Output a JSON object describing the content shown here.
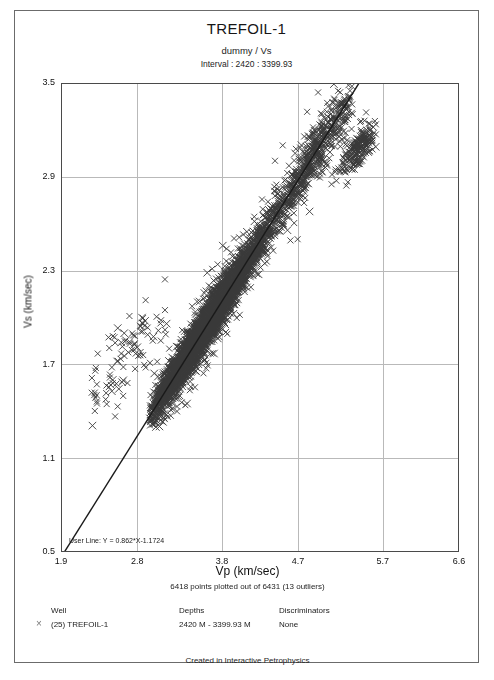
{
  "header": {
    "title": "TREFOIL-1",
    "subtitle": "dummy / Vs",
    "interval": "Interval : 2420 : 3399.93"
  },
  "footer": {
    "credit": "Created in Interactive Petrophysics"
  },
  "legend": {
    "marker_glyph": "×",
    "headers": {
      "well": "Well",
      "depths": "Depths",
      "discriminators": "Discriminators"
    },
    "rows": [
      {
        "marker": "×",
        "well": "(25) TREFOIL-1",
        "depths": "2420 M - 3399.93 M",
        "discriminators": "None"
      }
    ]
  },
  "chart_data": {
    "type": "scatter",
    "title": "TREFOIL-1",
    "subtitle": "dummy / Vs",
    "xlabel": "Vp (km/sec)",
    "ylabel": "Vs (km/sec)",
    "xlim": [
      1.9,
      6.6
    ],
    "ylim": [
      0.5,
      3.5
    ],
    "xticks": [
      1.9,
      2.8,
      3.8,
      4.7,
      5.7,
      6.6
    ],
    "xtick_labels": [
      "1.9",
      "2.8",
      "3.8",
      "4.7",
      "5.7",
      "6.6"
    ],
    "yticks": [
      0.5,
      1.1,
      1.7,
      2.3,
      2.9,
      3.5
    ],
    "ytick_labels": [
      "0.5",
      "1.1",
      "1.7",
      "2.3",
      "2.9",
      "3.5"
    ],
    "grid": true,
    "grid_color": "#b9b9b9",
    "frame_color": "#4a4a4a",
    "marker": "x",
    "marker_color": "#3a3a3a",
    "marker_size": 3.0,
    "n_points_plotted": 6418,
    "n_points_total": 6431,
    "n_outliers": 13,
    "points_note": "6418 points plotted out of 6431 (13 outliers)",
    "annotation": "User Line: Y = 0.862*X-1.1724",
    "fit_line": {
      "label": "User Line: Y = 0.862*X-1.1724",
      "slope": 0.862,
      "intercept": -1.1724,
      "color": "#1a1a1a",
      "width": 1.4
    },
    "clusters": [
      {
        "name": "main-trend",
        "n": 5500,
        "x_range": [
          2.95,
          4.55
        ],
        "x_peak": 3.62,
        "x_spread": 0.33,
        "slope": 0.862,
        "intercept": -1.1724,
        "scatter_perp": 0.055,
        "scatter_tail": 0.11
      },
      {
        "name": "upper-branch",
        "n": 620,
        "x_range": [
          4.25,
          5.35
        ],
        "x_peak": 4.85,
        "x_spread": 0.3,
        "slope": 0.862,
        "intercept": -1.1724,
        "scatter_perp": 0.085,
        "scatter_tail": 0.16
      },
      {
        "name": "high-vs-tail",
        "n": 200,
        "x_range": [
          5.05,
          5.62
        ],
        "x_peak": 5.42,
        "x_spread": 0.13,
        "slope": 0.52,
        "intercept": 0.27,
        "scatter_perp": 0.055,
        "scatter_tail": 0.09
      },
      {
        "name": "low-vp-scatter",
        "n": 98,
        "x_range": [
          2.25,
          3.15
        ],
        "x_peak": 2.7,
        "x_spread": 0.27,
        "slope": 0.6,
        "intercept": 0.15,
        "scatter_perp": 0.115,
        "scatter_tail": 0.2
      }
    ]
  },
  "geometry": {
    "plot_left": 46,
    "plot_top": 72,
    "plot_right": 444,
    "plot_bottom": 541,
    "canvas_width": 465,
    "canvas_height": 600
  }
}
